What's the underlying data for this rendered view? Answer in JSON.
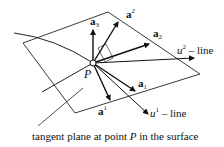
{
  "diagram": {
    "point_label": "P",
    "vectors": [
      {
        "name": "a3",
        "label": "a",
        "sub": "3",
        "sup": ""
      },
      {
        "name": "a-sup-2",
        "label": "a",
        "sub": "",
        "sup": "2"
      },
      {
        "name": "a2",
        "label": "a",
        "sub": "2",
        "sup": ""
      },
      {
        "name": "a1",
        "label": "a",
        "sub": "1",
        "sup": ""
      },
      {
        "name": "a-sup-1",
        "label": "a",
        "sub": "",
        "sup": "1"
      }
    ],
    "lines": [
      {
        "name": "u2-line",
        "var": "u",
        "sup": "2",
        "suffix": " – line"
      },
      {
        "name": "u1-line",
        "var": "u",
        "sup": "1",
        "suffix": " – line"
      }
    ],
    "caption": {
      "prefix": "tangent plane at point ",
      "point": "P",
      "suffix": " in the surface"
    }
  }
}
